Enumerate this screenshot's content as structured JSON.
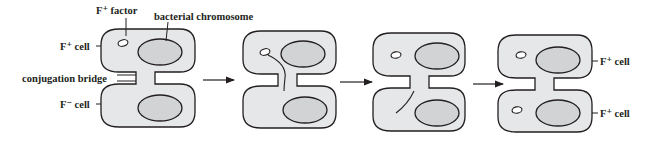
{
  "figure": {
    "labels": {
      "f_plus_factor": "F⁺ factor",
      "bacterial_chromosome": "bacterial chromosome",
      "f_plus_cell_left": "F⁺ cell",
      "conjugation_bridge": "conjugation bridge",
      "f_minus_cell_left": "F⁻ cell",
      "f_plus_cell_right_top": "F⁺ cell",
      "f_plus_cell_right_bottom": "F⁺ cell"
    },
    "stages": [
      {
        "step": 1,
        "description": "F+ cell with F+ factor joined to F- cell by conjugation bridge"
      },
      {
        "step": 2,
        "description": "F+ factor strand begins transfer through bridge"
      },
      {
        "step": 3,
        "description": "Single strand enters F- cell"
      },
      {
        "step": 4,
        "description": "Both cells now contain F+ factor (both F+ cells)"
      }
    ],
    "arrow_count": 3,
    "colors": {
      "cell_fill": "#e6e7e8",
      "chromosome_fill": "#d1d3d4",
      "outline": "#231f20",
      "background": "#ffffff"
    }
  }
}
